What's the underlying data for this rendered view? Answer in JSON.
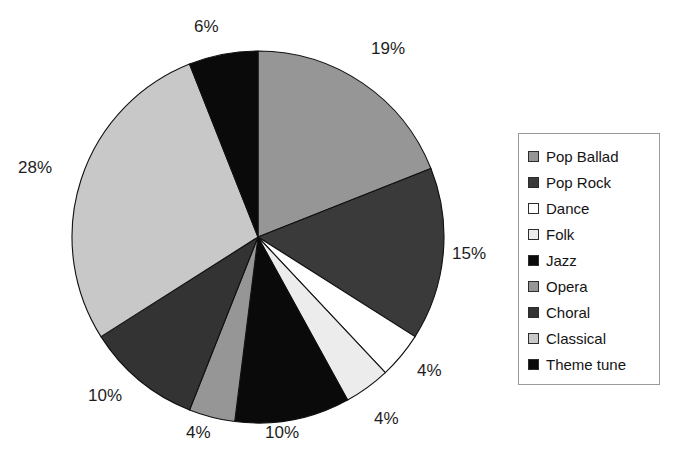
{
  "chart_data": {
    "type": "pie",
    "title": "",
    "subtitle": "",
    "xlabel": "",
    "ylabel": "",
    "legend_position": "right",
    "grid": false,
    "start_angle_deg": 0,
    "direction": "clockwise",
    "units": "percent",
    "total": 100,
    "categories": [
      "Pop Ballad",
      "Pop Rock",
      "Dance",
      "Folk",
      "Jazz",
      "Opera",
      "Choral",
      "Classical",
      "Theme tune"
    ],
    "values": [
      19,
      15,
      4,
      4,
      10,
      4,
      10,
      28,
      6
    ],
    "labels": [
      "19%",
      "15%",
      "4%",
      "4%",
      "10%",
      "4%",
      "10%",
      "28%",
      "6%"
    ],
    "colors": [
      "#969696",
      "#3a3a3a",
      "#ffffff",
      "#ececec",
      "#0a0a0a",
      "#969696",
      "#333333",
      "#c8c8c8",
      "#0a0a0a"
    ],
    "slice_border_color": "#111111",
    "background_color": "#ffffff",
    "slices": [
      {
        "name": "Pop Ballad",
        "value": 19,
        "label": "19%",
        "color": "#969696"
      },
      {
        "name": "Pop Rock",
        "value": 15,
        "label": "15%",
        "color": "#3a3a3a"
      },
      {
        "name": "Dance",
        "value": 4,
        "label": "4%",
        "color": "#ffffff"
      },
      {
        "name": "Folk",
        "value": 4,
        "label": "4%",
        "color": "#ececec"
      },
      {
        "name": "Jazz",
        "value": 10,
        "label": "10%",
        "color": "#0a0a0a"
      },
      {
        "name": "Opera",
        "value": 4,
        "label": "4%",
        "color": "#969696"
      },
      {
        "name": "Choral",
        "value": 10,
        "label": "10%",
        "color": "#333333"
      },
      {
        "name": "Classical",
        "value": 28,
        "label": "28%",
        "color": "#c8c8c8"
      },
      {
        "name": "Theme tune",
        "value": 6,
        "label": "6%",
        "color": "#0a0a0a"
      }
    ]
  },
  "geometry": {
    "center_x": 258,
    "center_y": 237,
    "radius": 186
  },
  "value_labels": [
    {
      "text": "6%",
      "x": 194,
      "y": 18
    },
    {
      "text": "19%",
      "x": 371,
      "y": 40
    },
    {
      "text": "15%",
      "x": 452,
      "y": 245
    },
    {
      "text": "4%",
      "x": 417,
      "y": 362
    },
    {
      "text": "4%",
      "x": 374,
      "y": 410
    },
    {
      "text": "10%",
      "x": 265,
      "y": 424
    },
    {
      "text": "4%",
      "x": 186,
      "y": 424
    },
    {
      "text": "10%",
      "x": 88,
      "y": 387
    },
    {
      "text": "28%",
      "x": 18,
      "y": 159
    }
  ],
  "legend": {
    "items": [
      {
        "label": "Pop Ballad",
        "color": "#969696"
      },
      {
        "label": "Pop Rock",
        "color": "#3a3a3a"
      },
      {
        "label": "Dance",
        "color": "#ffffff"
      },
      {
        "label": "Folk",
        "color": "#ececec"
      },
      {
        "label": "Jazz",
        "color": "#0a0a0a"
      },
      {
        "label": "Opera",
        "color": "#969696"
      },
      {
        "label": "Choral",
        "color": "#333333"
      },
      {
        "label": "Classical",
        "color": "#c8c8c8"
      },
      {
        "label": "Theme tune",
        "color": "#0a0a0a"
      }
    ]
  }
}
